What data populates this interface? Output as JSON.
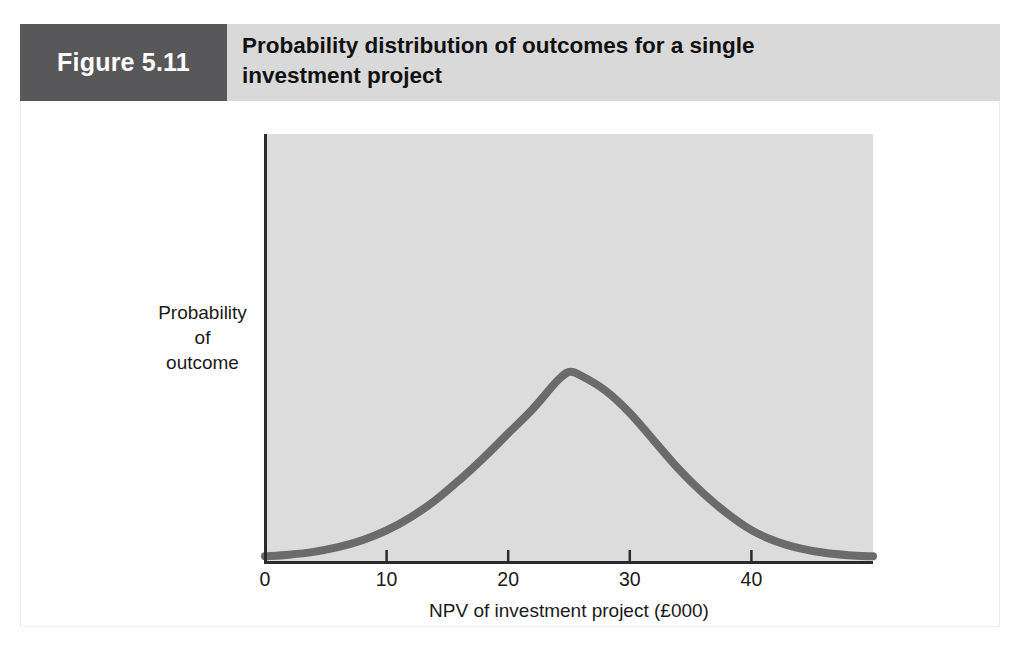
{
  "figure": {
    "number_label": "Figure 5.11",
    "title_line1": "Probability distribution of outcomes for a single",
    "title_line2": "investment project",
    "header_bg": "#d9d9d9",
    "number_box_bg": "#58585a",
    "number_text_color": "#ffffff"
  },
  "chart_data": {
    "type": "line",
    "title": "Probability distribution of outcomes for a single investment project",
    "subtitle": "",
    "xlabel": "NPV of investment project (£000)",
    "ylabel": "Probability of outcome",
    "ylabel_lines": [
      "Probability",
      "of",
      "outcome"
    ],
    "xlim": [
      0,
      50
    ],
    "ylim": [
      0,
      1
    ],
    "xticks": [
      0,
      10,
      20,
      30,
      40
    ],
    "xtick_labels": [
      "0",
      "10",
      "20",
      "30",
      "40"
    ],
    "yticks": [],
    "ytick_labels": [],
    "grid": false,
    "legend": null,
    "plot_bg": "#dcdcdc",
    "line_color": "#6b6b6b",
    "line_width": 8,
    "axis_color": "#2b2b2b",
    "annotations": [],
    "distribution": {
      "shape": "normal",
      "mean": 25,
      "std_dev": 8.2,
      "peak_x": 25,
      "peak_y": 1.0
    },
    "x": [
      0,
      2,
      4,
      6,
      8,
      10,
      12,
      14,
      16,
      18,
      20,
      22,
      24,
      25,
      26,
      28,
      30,
      32,
      34,
      36,
      38,
      40,
      42,
      44,
      46,
      48,
      50
    ],
    "y": [
      0.009,
      0.018,
      0.033,
      0.058,
      0.095,
      0.148,
      0.22,
      0.31,
      0.42,
      0.54,
      0.67,
      0.8,
      0.95,
      1.0,
      0.98,
      0.9,
      0.78,
      0.63,
      0.48,
      0.35,
      0.24,
      0.15,
      0.09,
      0.052,
      0.028,
      0.015,
      0.009
    ]
  }
}
